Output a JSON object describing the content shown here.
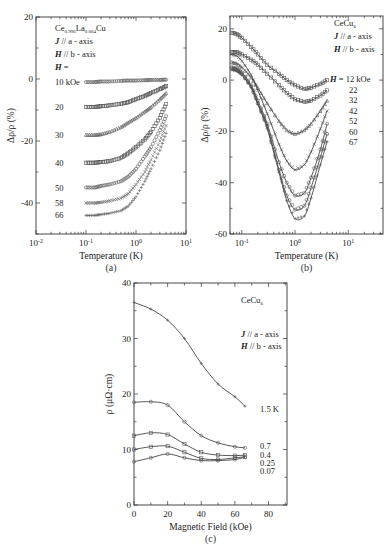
{
  "chart_data": [
    {
      "id": "a",
      "type": "scatter",
      "caption": "(a)",
      "xlabel": "Temperature (K)",
      "ylabel": "Δρ/ρ (%)",
      "xscale": "log",
      "xlim": [
        0.01,
        10
      ],
      "ylim": [
        -50,
        20
      ],
      "xticks": [
        {
          "v": 0.01,
          "label": "10-2"
        },
        {
          "v": 0.1,
          "label": "10-1"
        },
        {
          "v": 1,
          "label": "100"
        },
        {
          "v": 10,
          "label": "101"
        }
      ],
      "yticks": [
        {
          "v": 20,
          "label": "20"
        },
        {
          "v": 0,
          "label": "0"
        },
        {
          "v": -20,
          "label": "-20"
        },
        {
          "v": -40,
          "label": "-40"
        }
      ],
      "annotations": [
        "Ce0.996La0.004Cu",
        "J // a - axis",
        "H // b - axis",
        "H ="
      ],
      "compound": {
        "base": "Ce",
        "sub1": "0.996",
        "mid": "La",
        "sub2": "0.004",
        "tail": "Cu"
      },
      "series": [
        {
          "name": "10 kOe",
          "label": "10 kOe",
          "marker": "circle",
          "x": [
            0.1,
            0.15,
            0.2,
            0.3,
            0.5,
            0.7,
            1,
            1.5,
            2,
            3,
            4
          ],
          "y": [
            -1,
            -1,
            -0.8,
            -0.8,
            -0.6,
            -0.5,
            -0.5,
            -0.4,
            -0.3,
            -0.3,
            -0.2
          ]
        },
        {
          "name": "20 kOe",
          "label": "20",
          "marker": "square",
          "x": [
            0.1,
            0.15,
            0.2,
            0.3,
            0.5,
            0.7,
            1,
            1.5,
            2,
            3,
            4
          ],
          "y": [
            -9,
            -9,
            -8.8,
            -8.5,
            -8,
            -7.5,
            -6.5,
            -5.5,
            -4.5,
            -3.3,
            -2.3
          ]
        },
        {
          "name": "30 kOe",
          "label": "30",
          "marker": "triangle",
          "x": [
            0.1,
            0.15,
            0.2,
            0.3,
            0.5,
            0.7,
            1,
            1.5,
            2,
            3,
            4
          ],
          "y": [
            -18,
            -18,
            -17.8,
            -17,
            -15.5,
            -14,
            -12.5,
            -10.5,
            -9,
            -6.5,
            -4.5
          ]
        },
        {
          "name": "40 kOe",
          "label": "40",
          "marker": "square",
          "x": [
            0.1,
            0.15,
            0.2,
            0.3,
            0.5,
            0.7,
            1,
            1.5,
            2,
            3,
            4
          ],
          "y": [
            -27,
            -27,
            -26.8,
            -26.5,
            -25.5,
            -24,
            -22,
            -19.5,
            -17,
            -12.5,
            -8
          ]
        },
        {
          "name": "50 kOe",
          "label": "50",
          "marker": "circle",
          "x": [
            0.1,
            0.15,
            0.2,
            0.3,
            0.5,
            0.7,
            1,
            1.5,
            2,
            3,
            4
          ],
          "y": [
            -35,
            -35,
            -34.5,
            -34,
            -33,
            -31.5,
            -29,
            -25,
            -22,
            -16.5,
            -12
          ]
        },
        {
          "name": "58 kOe",
          "label": "58",
          "marker": "cross",
          "x": [
            0.1,
            0.15,
            0.2,
            0.3,
            0.5,
            0.7,
            1,
            1.5,
            2,
            3,
            4
          ],
          "y": [
            -40,
            -40,
            -39.8,
            -39.3,
            -38.5,
            -37,
            -34,
            -30,
            -26,
            -20,
            -15
          ]
        },
        {
          "name": "66 kOe",
          "label": "66",
          "marker": "plus",
          "x": [
            0.1,
            0.15,
            0.2,
            0.3,
            0.5,
            0.7,
            1,
            1.5,
            2,
            3,
            4
          ],
          "y": [
            -44,
            -44,
            -43.7,
            -43.3,
            -42.5,
            -41,
            -38,
            -33,
            -29,
            -23,
            -17.5
          ]
        }
      ]
    },
    {
      "id": "b",
      "type": "line",
      "caption": "(b)",
      "xlabel": "Temperature (K)",
      "ylabel": "Δρ/ρ (%)",
      "xscale": "log",
      "xlim": [
        0.06,
        45
      ],
      "ylim": [
        -60,
        25
      ],
      "xticks": [
        {
          "v": 0.1,
          "label": "10-1"
        },
        {
          "v": 1,
          "label": "100"
        },
        {
          "v": 10,
          "label": "101"
        }
      ],
      "yticks": [
        {
          "v": 20,
          "label": "20"
        },
        {
          "v": 0,
          "label": "0"
        },
        {
          "v": -20,
          "label": "-20"
        },
        {
          "v": -40,
          "label": "-40"
        },
        {
          "v": -60,
          "label": "-60"
        }
      ],
      "annotations": [
        "CeCu6",
        "J // a - axis",
        "H // b - axis",
        "H = 12 kOe"
      ],
      "compound": {
        "base": "CeCu",
        "sub1": "6"
      },
      "series": [
        {
          "name": "12 kOe",
          "label": "H = 12 kOe",
          "marker": "square",
          "x": [
            0.065,
            0.08,
            0.1,
            0.15,
            0.2,
            0.3,
            0.5,
            0.7,
            1,
            1.5,
            2,
            3,
            4
          ],
          "y": [
            18.5,
            18,
            16.5,
            13,
            10,
            6,
            2.5,
            0,
            -2,
            -3.5,
            -3,
            -1.5,
            0
          ]
        },
        {
          "name": "22 kOe",
          "label": "22",
          "marker": "square",
          "x": [
            0.065,
            0.08,
            0.1,
            0.15,
            0.2,
            0.3,
            0.5,
            0.7,
            1,
            1.5,
            2,
            3,
            4
          ],
          "y": [
            11,
            11,
            10,
            8,
            6,
            2.5,
            -2,
            -5,
            -7.5,
            -8.5,
            -8,
            -6,
            -4
          ]
        },
        {
          "name": "32 kOe",
          "label": "32",
          "marker": "triangle",
          "x": [
            0.065,
            0.08,
            0.1,
            0.15,
            0.2,
            0.3,
            0.5,
            0.7,
            1,
            1.5,
            2,
            3,
            4
          ],
          "y": [
            7,
            6.5,
            5,
            1,
            -3,
            -9,
            -16,
            -19.5,
            -21,
            -19.5,
            -17,
            -12,
            -8
          ]
        },
        {
          "name": "42 kOe",
          "label": "42",
          "marker": "cross",
          "x": [
            0.065,
            0.08,
            0.1,
            0.15,
            0.2,
            0.3,
            0.5,
            0.7,
            1,
            1.5,
            2,
            3,
            4
          ],
          "y": [
            10,
            9.5,
            7.5,
            2,
            -4,
            -13,
            -25,
            -31.5,
            -35,
            -33,
            -28,
            -19,
            -12
          ]
        },
        {
          "name": "52 kOe",
          "label": "52",
          "marker": "circle",
          "x": [
            0.065,
            0.08,
            0.1,
            0.15,
            0.2,
            0.3,
            0.5,
            0.7,
            1,
            1.5,
            2,
            3,
            4
          ],
          "y": [
            5,
            4.5,
            3,
            -2,
            -8,
            -17,
            -32,
            -40,
            -45,
            -44,
            -38,
            -27,
            -17
          ]
        },
        {
          "name": "60 kOe",
          "label": "60",
          "marker": "circle",
          "x": [
            0.065,
            0.08,
            0.1,
            0.15,
            0.2,
            0.3,
            0.5,
            0.7,
            1,
            1.5,
            2,
            3,
            4
          ],
          "y": [
            4.5,
            4,
            2.5,
            -2.5,
            -9,
            -18,
            -35,
            -45,
            -50.5,
            -49,
            -42,
            -30,
            -21
          ]
        },
        {
          "name": "67 kOe",
          "label": "67",
          "marker": "plus",
          "x": [
            0.065,
            0.08,
            0.1,
            0.15,
            0.2,
            0.3,
            0.5,
            0.7,
            1,
            1.5,
            2,
            3,
            4
          ],
          "y": [
            4,
            3.5,
            2,
            -3,
            -9.5,
            -19,
            -36,
            -47,
            -54,
            -53,
            -46,
            -33,
            -24
          ]
        }
      ]
    },
    {
      "id": "c",
      "type": "line",
      "caption": "(c)",
      "xlabel": "Magnetic Field (kOe)",
      "ylabel": "ρ (μΩ·cm)",
      "xscale": "linear",
      "xlim": [
        0,
        91
      ],
      "ylim": [
        0,
        40
      ],
      "xticks": [
        {
          "v": 0,
          "label": "0"
        },
        {
          "v": 20,
          "label": "20"
        },
        {
          "v": 40,
          "label": "40"
        },
        {
          "v": 60,
          "label": "60"
        },
        {
          "v": 80,
          "label": "80"
        }
      ],
      "yticks": [
        {
          "v": 0,
          "label": "0"
        },
        {
          "v": 10,
          "label": "10"
        },
        {
          "v": 20,
          "label": "20"
        },
        {
          "v": 30,
          "label": "30"
        },
        {
          "v": 40,
          "label": "40"
        }
      ],
      "annotations": [
        "CeCu6",
        "J // a - axis",
        "H // b - axis"
      ],
      "compound": {
        "base": "CeCu",
        "sub1": "6"
      },
      "series": [
        {
          "name": "1.5 K",
          "label": "1.5 K",
          "marker": "plus",
          "x": [
            0,
            10,
            20,
            30,
            40,
            50,
            60,
            66
          ],
          "y": [
            36.5,
            35.3,
            33.3,
            30,
            25.5,
            21.8,
            19.5,
            17.8
          ]
        },
        {
          "name": "0.7 K",
          "label": "0.7",
          "marker": "circle",
          "x": [
            0,
            10,
            20,
            30,
            40,
            50,
            60,
            66
          ],
          "y": [
            18.5,
            18.6,
            18,
            15,
            12.5,
            11.2,
            10.5,
            10.3
          ]
        },
        {
          "name": "0.4 K",
          "label": "0.4",
          "marker": "square",
          "x": [
            0,
            10,
            20,
            30,
            40,
            50,
            60,
            66
          ],
          "y": [
            12.5,
            13,
            12.7,
            11,
            9.5,
            9,
            8.9,
            9
          ]
        },
        {
          "name": "0.25 K",
          "label": "0.25",
          "marker": "square",
          "x": [
            0,
            10,
            20,
            30,
            40,
            50,
            60,
            66
          ],
          "y": [
            10,
            10.5,
            10.6,
            9.5,
            8.4,
            8.2,
            8.5,
            8.7
          ]
        },
        {
          "name": "0.07 K",
          "label": "0.07",
          "marker": "circle",
          "x": [
            0,
            10,
            20,
            30,
            40,
            50,
            60,
            66
          ],
          "y": [
            7.8,
            8.5,
            9.2,
            8.5,
            8,
            8,
            8.2,
            8.6
          ]
        }
      ]
    }
  ]
}
